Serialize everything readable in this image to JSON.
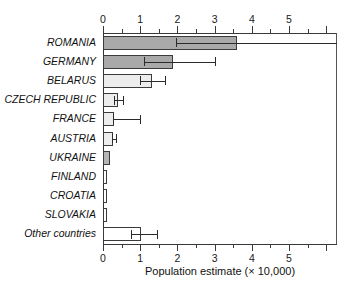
{
  "chart_data": {
    "type": "bar",
    "orientation": "horizontal",
    "title": "",
    "xlabel": "Population estimate (× 10,000)",
    "ylabel": "",
    "xlim": [
      0,
      6.32
    ],
    "grid": false,
    "legend": null,
    "axis_top": true,
    "axis_bottom": true,
    "major_ticks": [
      0,
      1,
      2,
      3,
      4,
      5
    ],
    "minor_tick_step": 0.5,
    "tick_labels": [
      "0",
      "1",
      "2",
      "3",
      "4",
      "5"
    ],
    "categories": [
      "ROMANIA",
      "GERMANY",
      "BELARUS",
      "CZECH REPUBLIC",
      "FRANCE",
      "AUSTRIA",
      "UKRAINE",
      "FINLAND",
      "CROATIA",
      "SLOVAKIA",
      "Other countries"
    ],
    "values": [
      3.6,
      1.88,
      1.32,
      0.4,
      0.3,
      0.27,
      0.19,
      0.11,
      0.11,
      0.11,
      1.03
    ],
    "error_low": [
      1.95,
      1.1,
      1.0,
      0.3,
      0.28,
      0.25,
      null,
      null,
      null,
      null,
      0.75
    ],
    "error_high": [
      6.32,
      3.0,
      1.68,
      0.55,
      1.0,
      0.35,
      null,
      null,
      null,
      null,
      1.45
    ],
    "bar_fills": [
      "#a9a9a9",
      "#a9a9a9",
      "#ededed",
      "#ededed",
      "#ededed",
      "#ededed",
      "#b4b4b4",
      "#ffffff",
      "#ffffff",
      "#ffffff",
      "#ffffff"
    ],
    "bar_edge_color": "#3b3b3b",
    "error_color": "#2b2b2b",
    "axis_color": "#3a3a3a"
  }
}
